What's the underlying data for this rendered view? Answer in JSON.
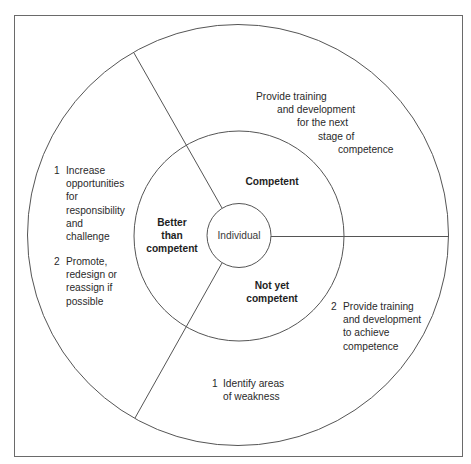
{
  "diagram": {
    "type": "concentric-circle-sectors",
    "colors": {
      "stroke": "#555555",
      "frame": "#6a6a6a",
      "text": "#2a2a2a",
      "background": "#ffffff"
    },
    "center": {
      "label": "Individual"
    },
    "inner_ring": {
      "segments": [
        {
          "id": "competent",
          "label": "Competent"
        },
        {
          "id": "not-yet-competent",
          "label_lines": [
            "Not yet",
            "competent"
          ]
        },
        {
          "id": "better-than-competent",
          "label_lines": [
            "Better",
            "than",
            "competent"
          ]
        }
      ]
    },
    "outer_ring": {
      "competent": {
        "lines": [
          "Provide training",
          "and development",
          "for the next",
          "stage of",
          "competence"
        ]
      },
      "better_than_competent": {
        "items": [
          {
            "number": "1",
            "lines": [
              "Increase",
              "opportunities",
              "for",
              "responsibility",
              "and",
              "challenge"
            ]
          },
          {
            "number": "2",
            "lines": [
              "Promote,",
              "redesign or",
              "reassign if",
              "possible"
            ]
          }
        ]
      },
      "not_yet_competent": {
        "items": [
          {
            "number": "1",
            "lines": [
              "Identify areas",
              "of weakness"
            ]
          },
          {
            "number": "2",
            "lines": [
              "Provide training",
              "and development",
              "to achieve",
              "competence"
            ]
          }
        ]
      }
    }
  }
}
